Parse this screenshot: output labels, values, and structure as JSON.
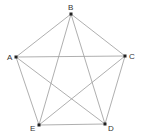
{
  "diagram": {
    "type": "complete-graph",
    "title": "",
    "colors": {
      "edge": "#9a9a9a",
      "vertex": "#222222",
      "label": "#333333",
      "background": "#ffffff"
    },
    "vertices": [
      {
        "id": "A",
        "label": "A",
        "x": 16,
        "y": 57,
        "lx": 7,
        "ly": 60
      },
      {
        "id": "B",
        "label": "B",
        "x": 71,
        "y": 14,
        "lx": 68,
        "ly": 10
      },
      {
        "id": "C",
        "label": "C",
        "x": 125,
        "y": 56,
        "lx": 129,
        "ly": 59
      },
      {
        "id": "D",
        "label": "D",
        "x": 105,
        "y": 124,
        "lx": 108,
        "ly": 131
      },
      {
        "id": "E",
        "label": "E",
        "x": 39,
        "y": 125,
        "lx": 30,
        "ly": 131
      }
    ],
    "edges": [
      [
        "A",
        "B"
      ],
      [
        "A",
        "C"
      ],
      [
        "A",
        "D"
      ],
      [
        "A",
        "E"
      ],
      [
        "B",
        "C"
      ],
      [
        "B",
        "D"
      ],
      [
        "B",
        "E"
      ],
      [
        "C",
        "D"
      ],
      [
        "C",
        "E"
      ],
      [
        "D",
        "E"
      ]
    ]
  }
}
